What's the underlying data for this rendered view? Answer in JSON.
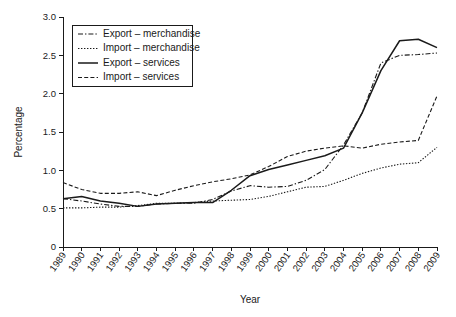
{
  "chart_data": {
    "type": "line",
    "title": "",
    "xlabel": "Year",
    "ylabel": "Percentage",
    "grid": false,
    "legend_position": "top-left",
    "xlim": [
      1989,
      2009
    ],
    "ylim": [
      0,
      3.0
    ],
    "ytick_labels": [
      "0",
      "0.5",
      "1.0",
      "1.5",
      "2.0",
      "2.5",
      "3.0"
    ],
    "ytick_values": [
      0,
      0.5,
      1.0,
      1.5,
      2.0,
      2.5,
      3.0
    ],
    "categories": [
      "1989",
      "1990",
      "1991",
      "1992",
      "1993",
      "1994",
      "1995",
      "1996",
      "1997",
      "1998",
      "1999",
      "2000",
      "2001",
      "2002",
      "2003",
      "2004",
      "2005",
      "2006",
      "2007",
      "2008",
      "2009"
    ],
    "series": [
      {
        "name": "Export – merchandise",
        "style": "dashdot",
        "color": "#1a1a1a",
        "values": [
          0.63,
          0.6,
          0.56,
          0.53,
          0.53,
          0.56,
          0.57,
          0.57,
          0.62,
          0.73,
          0.8,
          0.78,
          0.79,
          0.87,
          1.01,
          1.33,
          1.75,
          2.4,
          2.5,
          2.51,
          2.53
        ]
      },
      {
        "name": "Import – merchandise",
        "style": "dotted",
        "color": "#1a1a1a",
        "values": [
          0.51,
          0.51,
          0.52,
          0.52,
          0.54,
          0.57,
          0.57,
          0.58,
          0.6,
          0.61,
          0.62,
          0.66,
          0.72,
          0.78,
          0.79,
          0.87,
          0.96,
          1.03,
          1.08,
          1.1,
          1.3
        ]
      },
      {
        "name": "Export – services",
        "style": "solid",
        "color": "#1a1a1a",
        "values": [
          0.63,
          0.66,
          0.6,
          0.57,
          0.53,
          0.56,
          0.57,
          0.58,
          0.58,
          0.74,
          0.93,
          1.01,
          1.07,
          1.13,
          1.19,
          1.29,
          1.75,
          2.3,
          2.69,
          2.71,
          2.6
        ]
      },
      {
        "name": "Import – services",
        "style": "dashed",
        "color": "#1a1a1a",
        "values": [
          0.84,
          0.75,
          0.7,
          0.7,
          0.72,
          0.67,
          0.74,
          0.8,
          0.85,
          0.89,
          0.94,
          1.05,
          1.18,
          1.25,
          1.29,
          1.32,
          1.29,
          1.34,
          1.37,
          1.39,
          1.97
        ]
      }
    ]
  },
  "legend": {
    "items": [
      {
        "label": "Export – merchandise",
        "style": "dashdot"
      },
      {
        "label": "Import – merchandise",
        "style": "dotted"
      },
      {
        "label": "Export – services",
        "style": "solid"
      },
      {
        "label": "Import – services",
        "style": "dashed"
      }
    ]
  },
  "axes": {
    "x_title": "Year",
    "y_title": "Percentage"
  }
}
